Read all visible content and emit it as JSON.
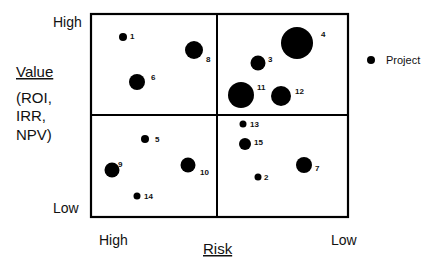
{
  "chart_data": {
    "type": "scatter",
    "subtype": "bubble-quadrant",
    "title": "",
    "xlabel": "Risk",
    "ylabel": "Value",
    "ylabel_sub": [
      "(ROI,",
      "IRR,",
      "NPV)"
    ],
    "x_ticks": {
      "left": "High",
      "right": "Low"
    },
    "y_ticks": {
      "top": "High",
      "bottom": "Low"
    },
    "legend": [
      {
        "label": "Project",
        "marker": "filled-circle",
        "color": "#000000"
      }
    ],
    "legend_position": "right",
    "grid": "2x2 quadrants",
    "xlim": [
      0,
      100
    ],
    "ylim": [
      0,
      100
    ],
    "x_direction": "High risk (left) to Low risk (right)",
    "y_direction": "Low value (bottom) to High value (top)",
    "points": [
      {
        "id": "1",
        "x": 12,
        "y": 88,
        "size": 4
      },
      {
        "id": "2",
        "x": 65,
        "y": 20,
        "size": 3.5
      },
      {
        "id": "3",
        "x": 65,
        "y": 75,
        "size": 7.5
      },
      {
        "id": "4",
        "x": 80,
        "y": 85,
        "size": 16
      },
      {
        "id": "5",
        "x": 21,
        "y": 38,
        "size": 4
      },
      {
        "id": "6",
        "x": 18,
        "y": 67,
        "size": 8
      },
      {
        "id": "7",
        "x": 83,
        "y": 26,
        "size": 8
      },
      {
        "id": "8",
        "x": 40,
        "y": 82,
        "size": 9
      },
      {
        "id": "9",
        "x": 8,
        "y": 23,
        "size": 7.5
      },
      {
        "id": "10",
        "x": 38,
        "y": 26,
        "size": 7.5
      },
      {
        "id": "11",
        "x": 58,
        "y": 60,
        "size": 13
      },
      {
        "id": "12",
        "x": 74,
        "y": 59,
        "size": 10
      },
      {
        "id": "13",
        "x": 59,
        "y": 46,
        "size": 3.5
      },
      {
        "id": "14",
        "x": 18,
        "y": 10,
        "size": 3.5
      },
      {
        "id": "15",
        "x": 60,
        "y": 36,
        "size": 6
      }
    ]
  },
  "layout": {
    "plot": {
      "left": 91,
      "top": 14,
      "right": 348,
      "bottom": 217
    },
    "colors": {
      "ink": "#000000",
      "background": "#ffffff",
      "text": "#111111"
    }
  },
  "bubbles_px": [
    {
      "id": "1",
      "cx": 123,
      "cy": 37,
      "r": 4,
      "lx": 130,
      "ly": 39
    },
    {
      "id": "2",
      "cx": 258,
      "cy": 177,
      "r": 3.5,
      "lx": 264,
      "ly": 180
    },
    {
      "id": "3",
      "cx": 258,
      "cy": 63,
      "r": 7.5,
      "lx": 268,
      "ly": 62
    },
    {
      "id": "4",
      "cx": 297,
      "cy": 43,
      "r": 16,
      "lx": 321,
      "ly": 37
    },
    {
      "id": "5",
      "cx": 145,
      "cy": 139,
      "r": 4,
      "lx": 155,
      "ly": 142
    },
    {
      "id": "6",
      "cx": 137,
      "cy": 82,
      "r": 8,
      "lx": 151,
      "ly": 80
    },
    {
      "id": "7",
      "cx": 304,
      "cy": 165,
      "r": 8,
      "lx": 315,
      "ly": 171
    },
    {
      "id": "8",
      "cx": 194,
      "cy": 50,
      "r": 9,
      "lx": 206,
      "ly": 62
    },
    {
      "id": "9",
      "cx": 112,
      "cy": 170,
      "r": 7.5,
      "lx": 118,
      "ly": 167
    },
    {
      "id": "10",
      "cx": 188,
      "cy": 165,
      "r": 7.5,
      "lx": 200,
      "ly": 175
    },
    {
      "id": "11",
      "cx": 241,
      "cy": 95,
      "r": 13,
      "lx": 257,
      "ly": 90
    },
    {
      "id": "12",
      "cx": 281,
      "cy": 96,
      "r": 10,
      "lx": 295,
      "ly": 94
    },
    {
      "id": "13",
      "cx": 243,
      "cy": 124,
      "r": 3.5,
      "lx": 250,
      "ly": 127
    },
    {
      "id": "14",
      "cx": 137,
      "cy": 196,
      "r": 3.5,
      "lx": 144,
      "ly": 199
    },
    {
      "id": "15",
      "cx": 245,
      "cy": 144,
      "r": 6,
      "lx": 254,
      "ly": 145
    }
  ],
  "labels_px": {
    "y_high": {
      "x": 53,
      "y": 27
    },
    "y_low": {
      "x": 53,
      "y": 213
    },
    "value": {
      "x": 16,
      "y": 77
    },
    "sub_lines_y": [
      103,
      121,
      140
    ],
    "sub_x": 16,
    "x_high": {
      "x": 99,
      "y": 245
    },
    "x_low": {
      "x": 331,
      "y": 245
    },
    "risk": {
      "x": 203,
      "y": 254
    },
    "legend_dot": {
      "cx": 371,
      "cy": 60,
      "r": 4
    },
    "legend_text": {
      "x": 386,
      "y": 64
    }
  }
}
